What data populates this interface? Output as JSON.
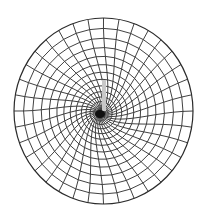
{
  "figure": {
    "description": "Circular finite element mesh refined toward a crack tip",
    "type": "quadrilateral mesh",
    "domain_shape": "circle",
    "colors": {
      "background": "#ffffff",
      "mesh_line": "#2b2b2b",
      "crack": "#c8c8c8",
      "tip_focus": "#111111"
    },
    "geometry": {
      "center_x": 103.5,
      "center_y": 111,
      "radius_x": 89.5,
      "radius_y": 93,
      "tip_x": 100,
      "tip_y": 114,
      "crack_top_y": 80,
      "crack_x": 104
    },
    "mesh": {
      "outer_divisions": 36,
      "rings": 16,
      "spiral_twist": 1.1
    }
  }
}
